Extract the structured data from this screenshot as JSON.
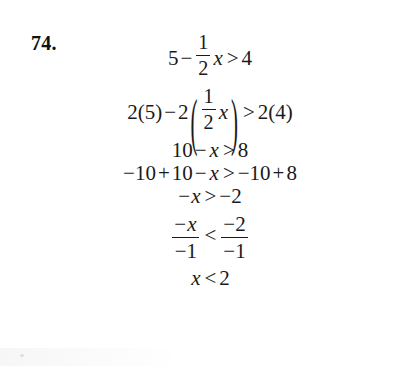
{
  "problem": {
    "number": "74."
  },
  "solution": {
    "lines": [
      {
        "id": "line-1",
        "text": "5 − (1/2)x > 4",
        "parts": {
          "lhs_first": "5",
          "minus": "−",
          "frac_num": "1",
          "frac_den": "2",
          "var": "x",
          "relation": ">",
          "rhs": "4"
        }
      },
      {
        "id": "line-2",
        "text": "2(5) − 2( (1/2)x ) > 2(4)",
        "parts": {
          "lhs_first": "2(5)",
          "minus": "−",
          "coef": "2",
          "paren_open": "(",
          "frac_num": "1",
          "frac_den": "2",
          "var": "x",
          "paren_close": ")",
          "relation": ">",
          "rhs": "2(4)"
        }
      },
      {
        "id": "line-3",
        "text": "10 − x > 8",
        "parts": {
          "lhs_first": "10",
          "minus": "−",
          "var": "x",
          "relation": ">",
          "rhs": "8"
        }
      },
      {
        "id": "line-4",
        "text": "−10 + 10 − x > −10 + 8",
        "parts": {
          "lhs_first": "−10",
          "plus": "+",
          "lhs_second": "10",
          "minus": "−",
          "var": "x",
          "relation": ">",
          "rhs_first": "−10",
          "rhs_plus": "+",
          "rhs_second": "8"
        }
      },
      {
        "id": "line-5",
        "text": "−x > −2",
        "parts": {
          "minus": "−",
          "var": "x",
          "relation": ">",
          "rhs": "−2"
        }
      },
      {
        "id": "line-6",
        "text": "(−x)/(−1) < (−2)/(−1)",
        "parts": {
          "lhs_num_minus": "−",
          "lhs_num_var": "x",
          "lhs_den": "−1",
          "relation": "<",
          "rhs_num": "−2",
          "rhs_den": "−1"
        }
      },
      {
        "id": "line-7",
        "text": "x < 2",
        "parts": {
          "var": "x",
          "relation": "<",
          "rhs": "2"
        }
      }
    ]
  }
}
